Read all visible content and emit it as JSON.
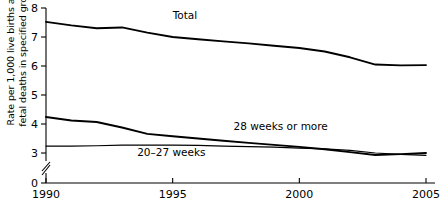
{
  "chart_data": {
    "type": "line",
    "title": "",
    "xlabel": "",
    "ylabel": "Rate per 1,000 live births and fetal deaths in specified group",
    "xlim": [
      1990,
      2005
    ],
    "ylim": [
      3,
      8
    ],
    "y_axis_break": true,
    "y_break_from": 0,
    "y_break_to": 3,
    "grid": false,
    "legend_position": "inline-annotations",
    "xticks": [
      1990,
      1995,
      2000,
      2005
    ],
    "xtick_labels": [
      "1990",
      "1995",
      "2000",
      "2005"
    ],
    "yticks": [
      0,
      3,
      4,
      5,
      6,
      7,
      8
    ],
    "ytick_labels": [
      "0",
      "3",
      "4",
      "5",
      "6",
      "7",
      "8"
    ],
    "x": [
      1990,
      1991,
      1992,
      1993,
      1994,
      1995,
      1996,
      1997,
      1998,
      1999,
      2000,
      2001,
      2002,
      2003,
      2004,
      2005
    ],
    "series": [
      {
        "name": "Total",
        "label": "Total",
        "color": "#000000",
        "width": 1.9,
        "values": [
          7.52,
          7.4,
          7.3,
          7.33,
          7.15,
          7.0,
          6.92,
          6.85,
          6.78,
          6.7,
          6.62,
          6.5,
          6.3,
          6.05,
          6.02,
          6.03
        ]
      },
      {
        "name": "28 weeks or more",
        "label": "28 weeks or more",
        "color": "#000000",
        "width": 1.9,
        "values": [
          4.24,
          4.12,
          4.07,
          3.88,
          3.66,
          3.58,
          3.5,
          3.42,
          3.35,
          3.28,
          3.21,
          3.13,
          3.03,
          2.93,
          2.96,
          3.0
        ]
      },
      {
        "name": "20-27 weeks",
        "label": "20–27 weeks",
        "color": "#000000",
        "width": 1.2,
        "values": [
          3.24,
          3.24,
          3.25,
          3.27,
          3.27,
          3.27,
          3.26,
          3.24,
          3.22,
          3.2,
          3.17,
          3.14,
          3.09,
          3.0,
          2.95,
          2.92
        ]
      }
    ],
    "annotations": [
      {
        "text": "Total",
        "x": 1995.0,
        "y": 7.62
      },
      {
        "text": "28 weeks or more",
        "x": 1997.4,
        "y": 3.8
      },
      {
        "text": "20–27 weeks",
        "x": 1993.6,
        "y": 2.88
      }
    ]
  }
}
